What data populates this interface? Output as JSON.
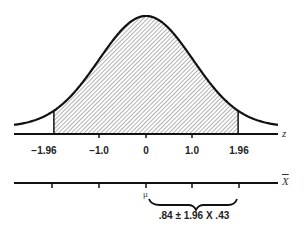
{
  "diagram": {
    "type": "normal-distribution",
    "z_axis": {
      "name": "z",
      "ticks": [
        {
          "value": -1.96,
          "label": "−1.96"
        },
        {
          "value": -1.0,
          "label": "−1.0"
        },
        {
          "value": 0,
          "label": "0"
        },
        {
          "value": 1.0,
          "label": "1.0"
        },
        {
          "value": 1.96,
          "label": "1.96"
        }
      ]
    },
    "shaded_region": {
      "from": -1.96,
      "to": 1.96
    },
    "xbar_axis": {
      "name": "X",
      "mean_label": "μ",
      "interval_label": ".84 ± 1.96 X .43"
    },
    "colors": {
      "line": "#111111",
      "hatch": "#555555",
      "background": "#ffffff"
    }
  }
}
